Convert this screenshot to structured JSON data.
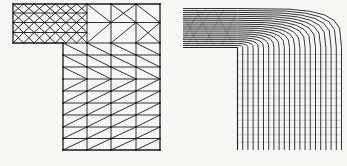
{
  "page": {
    "width": 347,
    "height": 166,
    "background": "#f7f6f3"
  },
  "diagram": {
    "description_left": "finite-element-triangular-mesh-on-inverted-L-domain",
    "description_right": "streamlines-turning-reentrant-corner",
    "mesh": {
      "stroke": "#1a1a1a",
      "line_w": 0.9,
      "outline_w": 1.3,
      "node_r": 0.9,
      "arm_node_r": 0.7,
      "outline": [
        [
          13,
          4
        ],
        [
          160,
          4
        ],
        [
          160,
          150
        ],
        [
          63,
          150
        ],
        [
          63,
          43
        ],
        [
          13,
          43
        ]
      ],
      "arm": {
        "x0": 13,
        "x1": 87,
        "cols": 7,
        "rows": [
          4,
          13,
          22.5,
          32.5,
          43
        ]
      },
      "bar_right": {
        "xs": [
          87,
          111,
          136,
          160
        ],
        "ys": [
          4,
          22.5,
          43
        ],
        "diags": [
          [
            "\\",
            "X",
            "\\"
          ],
          [
            "/",
            "/",
            "X"
          ]
        ]
      },
      "column": {
        "xs": [
          63,
          87,
          111,
          136,
          160
        ],
        "ys": [
          43,
          55,
          67,
          79,
          91,
          103,
          115,
          127,
          138.5,
          150
        ],
        "row_diags": [
          "\\",
          "\\",
          "\\",
          "/",
          "/",
          "/",
          "/",
          "/",
          "/"
        ]
      }
    },
    "flow": {
      "stroke": "#1f1f1f",
      "line_w": 0.9,
      "wall_w": 1.1,
      "corner": [
        237.5,
        47.5
      ],
      "inlet_x": 183,
      "bottom_y": 150,
      "n": 20,
      "dx": 5.2,
      "dy": 1.95,
      "exp_start": 0.8,
      "exp_end": 0.52,
      "theta_deg": [
        0,
        15,
        30,
        45,
        60,
        75,
        90
      ],
      "wall": [
        [
          183,
          47.5
        ],
        [
          237.5,
          47.5
        ],
        [
          237.5,
          150
        ]
      ],
      "grid": {
        "y0": 54.5,
        "y1": 149,
        "step": 7.3,
        "x0": 238.5,
        "x1": 341.5,
        "color": "#b9b6b0",
        "w": 0.6
      },
      "bar_mesh": {
        "color": "#8f8f89",
        "w": 0.6,
        "opacity": 0.8,
        "segs": [
          [
            183,
            30,
            206,
            9
          ],
          [
            186,
            46,
            212,
            10
          ],
          [
            196,
            9,
            214,
            46
          ],
          [
            205,
            44,
            224,
            9
          ],
          [
            214,
            9,
            233,
            44
          ],
          [
            222,
            46,
            236,
            12
          ],
          [
            183,
            14,
            199,
            46
          ],
          [
            200,
            10,
            183,
            40
          ]
        ]
      }
    }
  }
}
